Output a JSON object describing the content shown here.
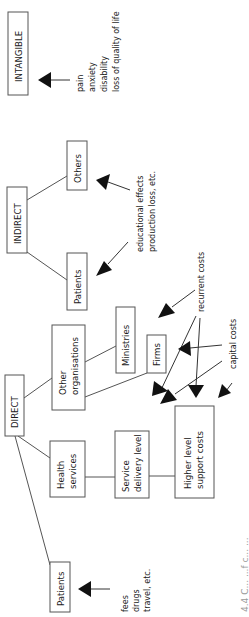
{
  "diagram": {
    "type": "cost classification tree (rotated 90° counter-clockwise)",
    "categories": {
      "intangible": {
        "label": "INTANGIBLE",
        "notes": [
          "pain",
          "anxiety",
          "disability",
          "loss of quality of life"
        ]
      },
      "indirect": {
        "label": "INDIRECT",
        "children": [
          {
            "label": "Others"
          },
          {
            "label": "Patients"
          }
        ],
        "notes": [
          "educational effects",
          "production loss, etc."
        ]
      },
      "direct": {
        "label": "DIRECT",
        "children": [
          {
            "label_lines": [
              "Other",
              "organisations"
            ],
            "children": [
              {
                "label": "Ministries"
              },
              {
                "label": "Firms"
              }
            ]
          },
          {
            "label_lines": [
              "Health",
              "services"
            ],
            "children": [
              {
                "label_lines": [
                  "Service",
                  "delivery level"
                ]
              },
              {
                "label_lines": [
                  "Higher level",
                  "support costs"
                ]
              }
            ]
          },
          {
            "label": "Patients",
            "notes": [
              "fees",
              "drugs",
              "travel, etc."
            ]
          }
        ]
      }
    },
    "cost_types": {
      "recurrent": "recurrent costs",
      "capital": "capital costs"
    },
    "caption_partial": "4.4 C... ...f c... ..."
  }
}
